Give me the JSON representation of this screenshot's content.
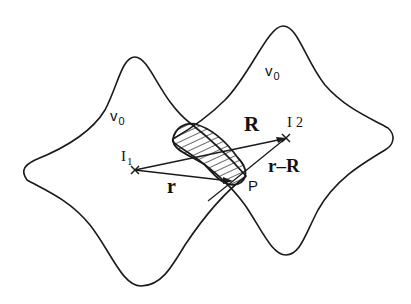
{
  "diagram": {
    "labels": {
      "v0_left": {
        "main": "v",
        "sub": "0"
      },
      "v0_right": {
        "main": "v",
        "sub": "0"
      },
      "I1": {
        "main": "I",
        "sub": "1"
      },
      "I2": {
        "main": "I",
        "sub": "2"
      },
      "R": "R",
      "r": "r",
      "r_minus_R": "r–R",
      "P": "P"
    },
    "points": {
      "I1": [
        135,
        170
      ],
      "I2": [
        286,
        138
      ],
      "P": [
        233,
        181
      ]
    },
    "colors": {
      "stroke": "#1a1a1a",
      "background": "#ffffff"
    },
    "shapes": [
      {
        "name": "left-cell",
        "top": [
          135,
          57
        ],
        "left": [
          25,
          172
        ],
        "bottom": [
          141,
          286
        ],
        "right": [
          246,
          176
        ]
      },
      {
        "name": "right-cell",
        "top": [
          283,
          26
        ],
        "right": [
          393,
          140
        ],
        "bottom": [
          286,
          255
        ],
        "left": [
          173,
          139
        ]
      }
    ]
  }
}
